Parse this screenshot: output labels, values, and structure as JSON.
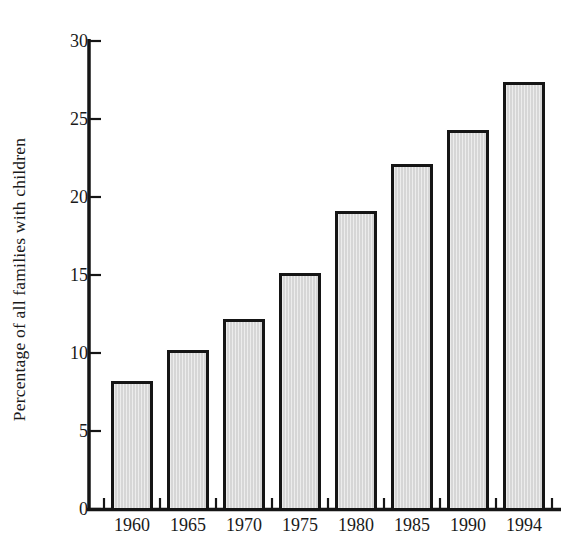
{
  "chart_data": {
    "type": "bar",
    "title": "",
    "xlabel": "",
    "ylabel": "Percentage of all families with children",
    "categories": [
      "1960",
      "1965",
      "1970",
      "1975",
      "1980",
      "1985",
      "1990",
      "1994"
    ],
    "values": [
      8.2,
      10.2,
      12.2,
      15.1,
      19.1,
      22.1,
      24.3,
      27.4
    ],
    "ylim": [
      0,
      30
    ],
    "yticks": [
      0,
      5,
      10,
      15,
      20,
      25,
      30
    ],
    "ytick_labels": [
      "0",
      "5",
      "10",
      "15",
      "20",
      "25",
      "30"
    ],
    "grid": false,
    "legend": false,
    "legend_position": "none",
    "bar_fill_color": "#d6d6d6",
    "bar_edge_color": "#151515",
    "axis_color": "#151515",
    "background_color": "#ffffff"
  }
}
